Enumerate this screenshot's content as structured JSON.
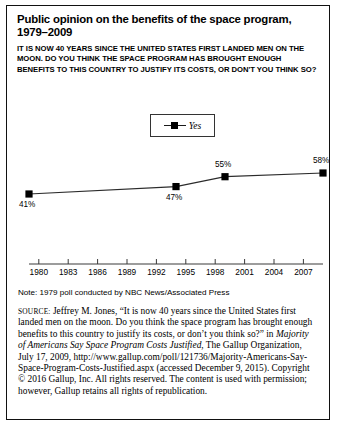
{
  "figure": {
    "title": "Public opinion on the benefits of the space program, 1979–2009",
    "question": "IT IS NOW 40 YEARS SINCE THE UNITED STATES FIRST LANDED MEN ON THE MOON. DO YOU THINK THE SPACE PROGRAM HAS BROUGHT ENOUGH BENEFITS TO THIS COUNTRY TO JUSTIFY ITS COSTS, OR DON'T YOU THINK SO?",
    "note": "Note: 1979 poll conducted by NBC News/Associated Press",
    "source_label": "source:",
    "source_text_1": " Jeffrey M. Jones, “It is now 40 years since the United States first landed men on the moon. Do you think the space program has brought enough benefits to this country to justify its costs, or don’t you think so?” in ",
    "source_title_italic": "Majority of Americans Say Space Program Costs Justified",
    "source_text_2": ", The Gallup Organization, July 17, 2009, http://www.gallup.com/poll/121736/Majority-Americans-Say-Space-Program-Costs-Justified.aspx (accessed December 9, 2015). Copyright © 2016 Gallup, Inc. All rights reserved. The content is used with permission; however, Gallup retains all rights of republication."
  },
  "legend": {
    "series_label": "Yes"
  },
  "colors": {
    "line": "#2b2b2b",
    "marker": "#000000",
    "axis": "#3a3a3a",
    "frame": "#111111",
    "text": "#000000"
  },
  "chart_data": {
    "type": "line",
    "title": "Public opinion on the benefits of the space program, 1979–2009",
    "xlabel": "",
    "ylabel": "",
    "grid": false,
    "legend_position": "top-center",
    "xlim": [
      1979,
      2009
    ],
    "ylim": [
      0,
      100
    ],
    "axis_tick_labels": [
      "1980",
      "1983",
      "1986",
      "1989",
      "1992",
      "1995",
      "1998",
      "2001",
      "2004",
      "2007"
    ],
    "axis_tick_years": [
      1980,
      1983,
      1986,
      1989,
      1992,
      1995,
      1998,
      2001,
      2004,
      2007
    ],
    "series": [
      {
        "name": "Yes",
        "x": [
          1979,
          1994,
          1999,
          2009
        ],
        "values": [
          41,
          47,
          55,
          58
        ],
        "data_labels": [
          "41%",
          "47%",
          "55%",
          "58%"
        ],
        "label_positions": [
          "below",
          "below",
          "above",
          "above"
        ]
      }
    ]
  }
}
